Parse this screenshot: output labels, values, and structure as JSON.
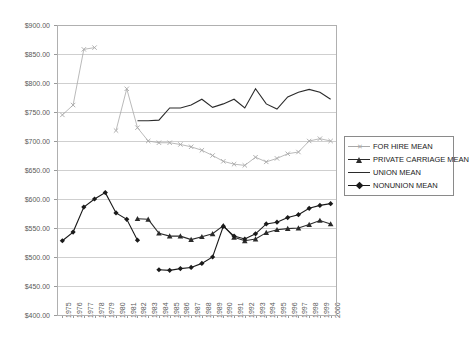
{
  "chart_data": {
    "type": "line",
    "title": "",
    "subtitle": "",
    "xlabel": "",
    "ylabel": "",
    "grid": true,
    "legend_position": "right",
    "ylim": [
      400,
      900
    ],
    "ytick_step": 50,
    "ytick_labels": [
      "$900.00",
      "$850.00",
      "$800.00",
      "$750.00",
      "$700.00",
      "$650.00",
      "$600.00",
      "$550.00",
      "$500.00",
      "$450.00",
      "$400.00"
    ],
    "ytick_values": [
      900,
      850,
      800,
      750,
      700,
      650,
      600,
      550,
      500,
      450,
      400
    ],
    "categories": [
      "1975",
      "1976",
      "1977",
      "1978",
      "1979",
      "1980",
      "1981",
      "1982",
      "1983",
      "1984",
      "1985",
      "1986",
      "1987",
      "1988",
      "1989",
      "1990",
      "1991",
      "1992",
      "1993",
      "1994",
      "1995",
      "1996",
      "1997",
      "1998",
      "1999",
      "2000"
    ],
    "x": [
      1975,
      1976,
      1977,
      1978,
      1979,
      1980,
      1981,
      1982,
      1983,
      1984,
      1985,
      1986,
      1987,
      1988,
      1989,
      1990,
      1991,
      1992,
      1993,
      1994,
      1995,
      1996,
      1997,
      1998,
      1999,
      2000
    ],
    "series": [
      {
        "name": "FOR HIRE MEAN",
        "color": "#a8a8a8",
        "marker": "x",
        "values": [
          745,
          762,
          858,
          861,
          null,
          718,
          790,
          723,
          700,
          697,
          697,
          694,
          690,
          684,
          675,
          665,
          660,
          658,
          672,
          664,
          670,
          678,
          681,
          700,
          704,
          700
        ]
      },
      {
        "name": "PRIVATE CARRIAGE MEAN",
        "color": "#2b2b2b",
        "marker": "triangle",
        "values": [
          null,
          null,
          null,
          null,
          null,
          null,
          null,
          566,
          565,
          541,
          536,
          536,
          530,
          535,
          540,
          554,
          534,
          528,
          531,
          542,
          547,
          549,
          550,
          556,
          563,
          557
        ]
      },
      {
        "name": "UNION MEAN",
        "color": "#2b2b2b",
        "marker": "none",
        "values": [
          null,
          null,
          null,
          null,
          null,
          null,
          null,
          735,
          735,
          736,
          757,
          757,
          762,
          772,
          758,
          764,
          772,
          757,
          790,
          764,
          755,
          776,
          784,
          789,
          784,
          772
        ]
      },
      {
        "name": "NONUNION MEAN",
        "color": "#1a1a1a",
        "marker": "diamond",
        "values": [
          528,
          543,
          586,
          600,
          611,
          576,
          565,
          529,
          null,
          478,
          477,
          480,
          482,
          489,
          500,
          553,
          536,
          531,
          540,
          557,
          560,
          568,
          573,
          584,
          589,
          592
        ]
      }
    ],
    "legend": [
      {
        "label": "FOR HIRE MEAN",
        "color": "#a8a8a8",
        "marker": "x"
      },
      {
        "label": "PRIVATE CARRIAGE MEAN",
        "color": "#2b2b2b",
        "marker": "triangle"
      },
      {
        "label": "UNION MEAN",
        "color": "#2b2b2b",
        "marker": "none"
      },
      {
        "label": "NONUNION MEAN",
        "color": "#1a1a1a",
        "marker": "diamond"
      }
    ]
  },
  "plot": {
    "axis_color": "#b0b0b0",
    "grid_color": "#cfcfcf",
    "background": "#ffffff"
  }
}
